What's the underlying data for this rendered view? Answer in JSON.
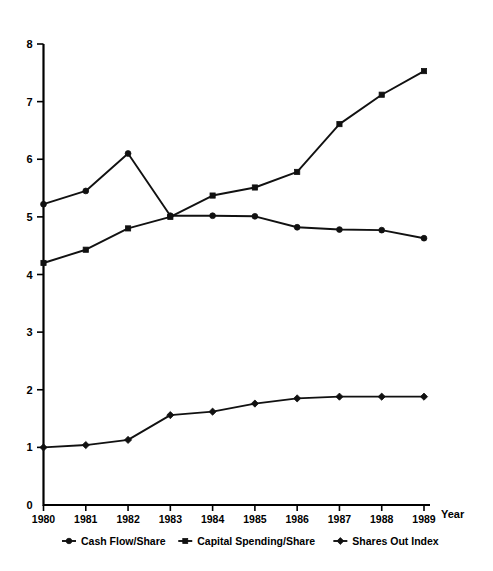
{
  "chart_data": {
    "type": "line",
    "title": "",
    "xlabel": "Year",
    "ylabel": "",
    "x": [
      1980,
      1981,
      1982,
      1983,
      1984,
      1985,
      1986,
      1987,
      1988,
      1989
    ],
    "categories": [
      "1980",
      "1981",
      "1982",
      "1983",
      "1984",
      "1985",
      "1986",
      "1987",
      "1988",
      "1989"
    ],
    "xlim": [
      1980,
      1989
    ],
    "ylim": [
      0,
      8
    ],
    "yticks": [
      0,
      1,
      2,
      3,
      4,
      5,
      6,
      7,
      8
    ],
    "ytick_labels": [
      "0",
      "1",
      "2",
      "3",
      "4",
      "5",
      "6",
      "7",
      "8"
    ],
    "grid": false,
    "legend_position": "bottom",
    "series": [
      {
        "name": "Cash Flow/Share",
        "marker": "circle",
        "color": "#111111",
        "values": [
          5.22,
          5.45,
          6.1,
          5.02,
          5.02,
          5.01,
          4.82,
          4.78,
          4.77,
          4.63
        ]
      },
      {
        "name": "Capital Spending/Share",
        "marker": "square",
        "color": "#111111",
        "values": [
          4.2,
          4.43,
          4.8,
          5.0,
          5.37,
          5.51,
          5.78,
          6.61,
          7.12,
          7.53
        ]
      },
      {
        "name": "Shares Out Index",
        "marker": "diamond",
        "color": "#111111",
        "values": [
          1.0,
          1.04,
          1.13,
          1.56,
          1.62,
          1.76,
          1.85,
          1.88,
          1.88,
          1.88
        ]
      }
    ]
  },
  "axes": {
    "x_axis_title": "Year"
  },
  "legend": {
    "items": [
      {
        "label": "Cash Flow/Share",
        "marker": "circle"
      },
      {
        "label": "Capital Spending/Share",
        "marker": "square"
      },
      {
        "label": "Shares Out Index",
        "marker": "diamond"
      }
    ]
  }
}
